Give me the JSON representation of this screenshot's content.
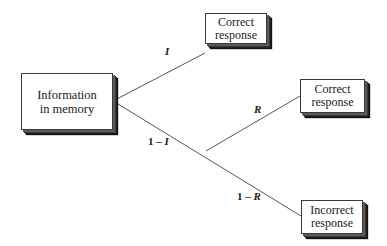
{
  "diagram": {
    "type": "probability-tree",
    "nodes": {
      "root": {
        "line1": "Information",
        "line2": "in memory"
      },
      "correct_top": {
        "line1": "Correct",
        "line2": "response"
      },
      "correct_mid": {
        "line1": "Correct",
        "line2": "response"
      },
      "incorrect": {
        "line1": "Incorrect",
        "line2": "response"
      }
    },
    "edges": {
      "root_to_correct_top": {
        "label": "I"
      },
      "root_to_branch": {
        "label_num": "1 – ",
        "label_var": "I"
      },
      "branch_to_correct_mid": {
        "label": "R"
      },
      "branch_to_incorrect": {
        "label_num": "1 – ",
        "label_var": "R"
      }
    }
  },
  "colors": {
    "line": "#555555",
    "box_border": "#3a3a3a",
    "shadow": "#1e1e1e",
    "background": "#ffffff"
  }
}
